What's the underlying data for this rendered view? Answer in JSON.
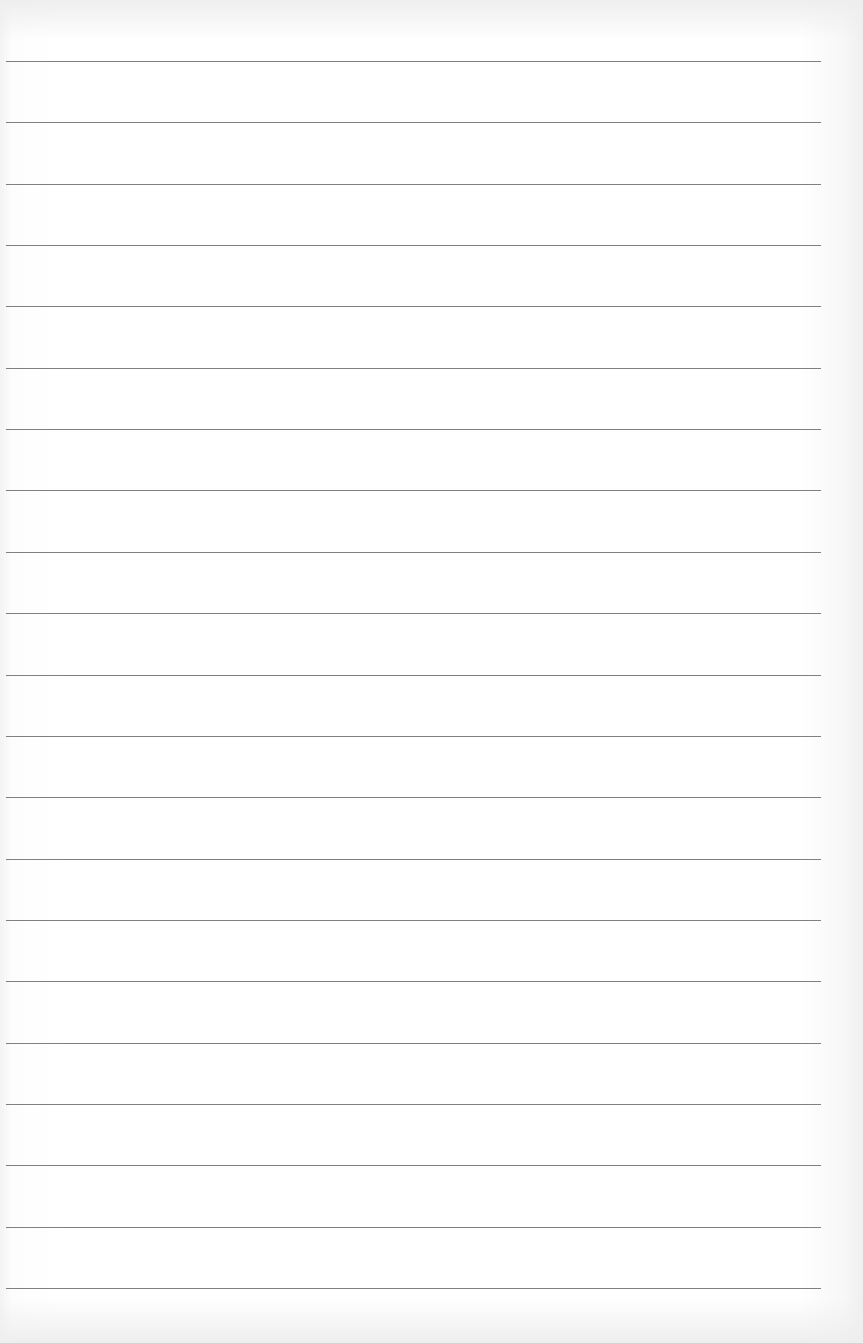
{
  "paper": {
    "type": "lined-paper",
    "line_count": 21,
    "first_line_y": 61,
    "line_spacing": 61.35,
    "line_left": 6,
    "line_right": 821,
    "colors": {
      "background": "#ffffff",
      "rule": "#6a6a6a"
    }
  }
}
